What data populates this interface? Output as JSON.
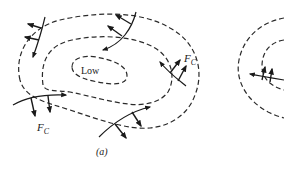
{
  "figure": {
    "panel_a": {
      "center_label": "Low",
      "force_label_main": "F",
      "force_label_sub": "C",
      "caption": "(a)"
    },
    "panel_b": {
      "note": "partially visible panel at right edge"
    }
  },
  "colors": {
    "line": "#1a1a1a",
    "isobar": "#2a2a2a",
    "background": "#ffffff"
  }
}
